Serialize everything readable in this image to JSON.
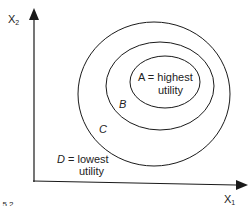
{
  "diagram": {
    "type": "indifference-curves",
    "axes": {
      "y_label": "X",
      "y_sub": "2",
      "x_label": "X",
      "x_sub": "1"
    },
    "curves": [
      {
        "id": "A",
        "letter": "A",
        "text": " = highest",
        "text2": "utility"
      },
      {
        "id": "B",
        "letter": "B"
      },
      {
        "id": "C",
        "letter": "C"
      },
      {
        "id": "D",
        "letter": "D",
        "text": " = lowest",
        "text2": "utility"
      }
    ],
    "caption_fragment": ". 5.2"
  },
  "colors": {
    "line": "#1a1a1a",
    "text": "#222222",
    "background": "#ffffff"
  }
}
